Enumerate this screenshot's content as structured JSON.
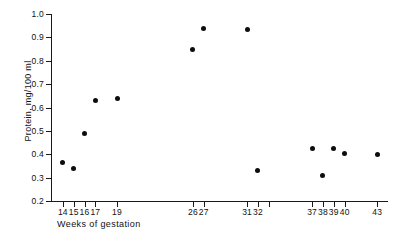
{
  "chart_data": {
    "type": "scatter",
    "title": "",
    "xlabel": "Weeks of gestation",
    "ylabel": "Protein, mg/100 ml",
    "xlim": [
      13,
      44
    ],
    "ylim": [
      0.2,
      1.0
    ],
    "grid": false,
    "legend": null,
    "x_tick_labels": [
      "14",
      "15",
      "16",
      "17",
      "19",
      "26",
      "27",
      "31",
      "32",
      "37",
      "38",
      "39",
      "40",
      "43"
    ],
    "x_ticks": [
      14,
      15,
      16,
      17,
      19,
      26,
      27,
      31,
      32,
      33,
      37,
      38,
      39,
      40,
      43
    ],
    "y_ticks": [
      0.2,
      0.3,
      0.4,
      0.5,
      0.6,
      0.7,
      0.8,
      0.9,
      1.0
    ],
    "y_tick_labels": [
      "0.2",
      "0.3",
      "0.4",
      "0.5",
      "0.6",
      "0.7",
      "0.8",
      "0.9",
      "1.0"
    ],
    "marker": "filled-circle",
    "marker_color": "#0d0d0d",
    "axis_color": "#1a1a1a",
    "background_color": "#ffffff",
    "x": [
      14,
      15,
      16,
      17,
      19,
      26,
      27,
      31,
      32,
      37,
      38,
      39,
      40,
      43
    ],
    "y": [
      0.363,
      0.34,
      0.49,
      0.628,
      0.64,
      0.85,
      0.94,
      0.935,
      0.33,
      0.425,
      0.31,
      0.425,
      0.405,
      0.4
    ],
    "points": [
      {
        "x": 14,
        "y": 0.363
      },
      {
        "x": 15,
        "y": 0.34
      },
      {
        "x": 16,
        "y": 0.49
      },
      {
        "x": 17,
        "y": 0.628
      },
      {
        "x": 19,
        "y": 0.64
      },
      {
        "x": 26,
        "y": 0.85
      },
      {
        "x": 27,
        "y": 0.94
      },
      {
        "x": 31,
        "y": 0.935
      },
      {
        "x": 32,
        "y": 0.33
      },
      {
        "x": 37,
        "y": 0.425
      },
      {
        "x": 38,
        "y": 0.31
      },
      {
        "x": 39,
        "y": 0.425
      },
      {
        "x": 40,
        "y": 0.405
      },
      {
        "x": 43,
        "y": 0.4
      }
    ]
  }
}
